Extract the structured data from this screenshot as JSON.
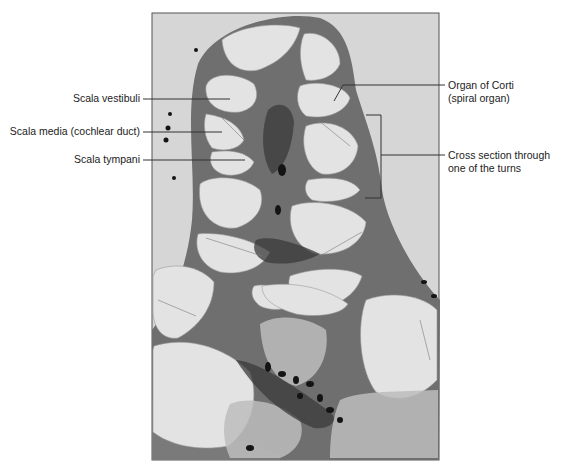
{
  "figure": {
    "colors": {
      "page_background": "#ffffff",
      "photo_background": "#d6d6d6",
      "tissue": "#6f6f6f",
      "tissue_light": "#8a8a8a",
      "chamber": "#e3e3e3",
      "dark_cells": "#1e1e1e",
      "leader": "#333333"
    }
  },
  "labels": {
    "left": [
      {
        "id": "scala-vestibuli",
        "text": "Scala vestibuli"
      },
      {
        "id": "scala-media",
        "text": "Scala media (cochlear duct)"
      },
      {
        "id": "scala-tympani",
        "text": "Scala tympani"
      }
    ],
    "right": [
      {
        "id": "organ-of-corti",
        "line1": "Organ of Corti",
        "line2": "(spiral organ)"
      },
      {
        "id": "cross-section",
        "line1": "Cross section through",
        "line2": "one of the turns"
      }
    ]
  }
}
